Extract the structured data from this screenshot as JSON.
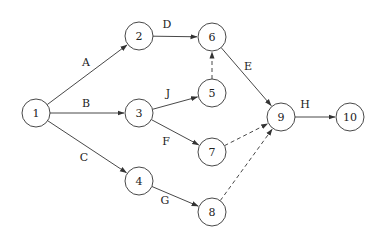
{
  "diagram": {
    "type": "activity-on-arrow network",
    "nodes": [
      {
        "id": "1",
        "label": "1",
        "x": 36,
        "y": 113
      },
      {
        "id": "2",
        "label": "2",
        "x": 139,
        "y": 36
      },
      {
        "id": "3",
        "label": "3",
        "x": 139,
        "y": 113
      },
      {
        "id": "4",
        "label": "4",
        "x": 139,
        "y": 181
      },
      {
        "id": "5",
        "label": "5",
        "x": 212,
        "y": 93
      },
      {
        "id": "6",
        "label": "6",
        "x": 212,
        "y": 37
      },
      {
        "id": "7",
        "label": "7",
        "x": 212,
        "y": 152
      },
      {
        "id": "8",
        "label": "8",
        "x": 212,
        "y": 212
      },
      {
        "id": "9",
        "label": "9",
        "x": 281,
        "y": 117
      },
      {
        "id": "10",
        "label": "10",
        "x": 350,
        "y": 117
      }
    ],
    "edges": [
      {
        "from": "1",
        "to": "2",
        "label": "A",
        "style": "solid",
        "lx": 86,
        "ly": 62
      },
      {
        "from": "1",
        "to": "3",
        "label": "B",
        "style": "solid",
        "lx": 86,
        "ly": 103
      },
      {
        "from": "1",
        "to": "4",
        "label": "C",
        "style": "solid",
        "lx": 84,
        "ly": 157
      },
      {
        "from": "2",
        "to": "6",
        "label": "D",
        "style": "solid",
        "lx": 167,
        "ly": 24
      },
      {
        "from": "3",
        "to": "5",
        "label": "J",
        "style": "solid",
        "lx": 168,
        "ly": 93
      },
      {
        "from": "3",
        "to": "7",
        "label": "F",
        "style": "solid",
        "lx": 166,
        "ly": 141
      },
      {
        "from": "4",
        "to": "8",
        "label": "G",
        "style": "solid",
        "lx": 165,
        "ly": 200
      },
      {
        "from": "5",
        "to": "6",
        "label": "",
        "style": "dashed"
      },
      {
        "from": "6",
        "to": "9",
        "label": "E",
        "style": "solid",
        "lx": 248,
        "ly": 66
      },
      {
        "from": "7",
        "to": "9",
        "label": "",
        "style": "dashed"
      },
      {
        "from": "8",
        "to": "9",
        "label": "",
        "style": "dashed"
      },
      {
        "from": "9",
        "to": "10",
        "label": "H",
        "style": "solid",
        "lx": 305,
        "ly": 104
      }
    ],
    "node_radius": 14,
    "colors": {
      "stroke": "#333333",
      "background": "#ffffff",
      "text": "#222222"
    }
  }
}
